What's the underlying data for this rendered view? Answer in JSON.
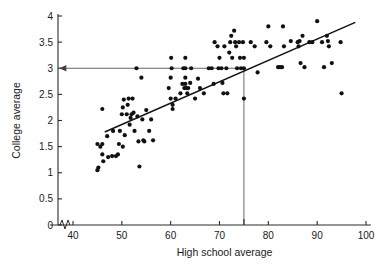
{
  "chart_data": {
    "type": "scatter",
    "title": "",
    "xlabel": "High school average",
    "ylabel": "College average",
    "xlim": [
      36,
      101
    ],
    "ylim": [
      0,
      4
    ],
    "xticks": [
      40,
      50,
      60,
      70,
      80,
      90,
      100
    ],
    "xtick_labels": [
      "40",
      "50",
      "60",
      "70",
      "80",
      "90",
      "100"
    ],
    "yticks": [
      0,
      0.5,
      1,
      1.5,
      2,
      2.5,
      3,
      3.5,
      4
    ],
    "ytick_labels": [
      "0",
      "0.5",
      "1",
      "1.5",
      "2",
      "2.5",
      "3",
      "3.5",
      "4"
    ],
    "grid": false,
    "legend": "none",
    "axis_break": {
      "axis": "x",
      "at": 37.5,
      "label": "zigzag-break"
    },
    "regression_line": {
      "x_start": 46.5,
      "y_start": 1.78,
      "x_end": 97.8,
      "y_end": 3.88,
      "slope": 0.0409,
      "intercept": -0.125
    },
    "reference_lines": [
      {
        "name": "horizontal-at-college-3",
        "orientation": "horizontal",
        "y": 3,
        "x_from": 37.2,
        "x_to": 75,
        "arrow": "left"
      },
      {
        "name": "vertical-at-highschool-75",
        "orientation": "vertical",
        "x": 75,
        "y_from": 0,
        "y_to": 3,
        "arrow": "none"
      }
    ],
    "points": [
      [
        45.0,
        1.55
      ],
      [
        45.0,
        1.05
      ],
      [
        45.2,
        1.1
      ],
      [
        45.6,
        1.5
      ],
      [
        46.0,
        1.55
      ],
      [
        46.0,
        2.22
      ],
      [
        46.2,
        1.22
      ],
      [
        46.0,
        1.35
      ],
      [
        47.0,
        1.7
      ],
      [
        47.2,
        1.3
      ],
      [
        48.0,
        1.32
      ],
      [
        48.2,
        1.8
      ],
      [
        48.8,
        1.32
      ],
      [
        49.2,
        1.35
      ],
      [
        49.4,
        1.55
      ],
      [
        49.6,
        1.8
      ],
      [
        50.0,
        2.12
      ],
      [
        50.2,
        2.25
      ],
      [
        50.2,
        1.5
      ],
      [
        50.4,
        2.4
      ],
      [
        50.6,
        1.72
      ],
      [
        51.0,
        2.12
      ],
      [
        51.2,
        2.3
      ],
      [
        51.4,
        2.42
      ],
      [
        51.6,
        1.92
      ],
      [
        51.8,
        2.05
      ],
      [
        52.0,
        2.12
      ],
      [
        52.2,
        2.42
      ],
      [
        52.4,
        2.15
      ],
      [
        52.6,
        1.8
      ],
      [
        53.0,
        3.0
      ],
      [
        53.2,
        2.08
      ],
      [
        53.4,
        1.6
      ],
      [
        53.6,
        1.12
      ],
      [
        54.0,
        2.82
      ],
      [
        54.2,
        2.02
      ],
      [
        54.4,
        1.62
      ],
      [
        54.6,
        1.6
      ],
      [
        55.0,
        2.2
      ],
      [
        55.6,
        1.8
      ],
      [
        56.0,
        2.02
      ],
      [
        56.4,
        1.62
      ],
      [
        59.6,
        2.62
      ],
      [
        60.0,
        2.42
      ],
      [
        60.0,
        2.82
      ],
      [
        60.1,
        3.2
      ],
      [
        60.2,
        3.0
      ],
      [
        60.4,
        2.3
      ],
      [
        60.4,
        2.22
      ],
      [
        61.0,
        2.42
      ],
      [
        62.0,
        2.52
      ],
      [
        62.4,
        2.7
      ],
      [
        62.6,
        3.0
      ],
      [
        62.8,
        2.62
      ],
      [
        63.0,
        3.2
      ],
      [
        63.0,
        3.0
      ],
      [
        63.0,
        2.82
      ],
      [
        63.0,
        2.7
      ],
      [
        63.2,
        2.62
      ],
      [
        63.4,
        2.52
      ],
      [
        63.6,
        2.62
      ],
      [
        64.0,
        2.72
      ],
      [
        64.2,
        3.0
      ],
      [
        65.0,
        2.42
      ],
      [
        65.6,
        2.8
      ],
      [
        66.0,
        2.62
      ],
      [
        66.8,
        2.52
      ],
      [
        67.8,
        3.0
      ],
      [
        68.4,
        3.0
      ],
      [
        68.8,
        2.7
      ],
      [
        69.0,
        3.5
      ],
      [
        69.6,
        3.42
      ],
      [
        69.8,
        3.0
      ],
      [
        70.0,
        3.2
      ],
      [
        70.4,
        3.0
      ],
      [
        70.6,
        2.72
      ],
      [
        70.8,
        2.52
      ],
      [
        71.0,
        3.42
      ],
      [
        71.4,
        3.0
      ],
      [
        71.6,
        2.52
      ],
      [
        72.0,
        3.3
      ],
      [
        72.2,
        3.5
      ],
      [
        72.4,
        3.62
      ],
      [
        72.6,
        3.2
      ],
      [
        73.0,
        3.72
      ],
      [
        73.2,
        3.5
      ],
      [
        73.4,
        3.42
      ],
      [
        73.6,
        3.0
      ],
      [
        74.0,
        3.5
      ],
      [
        74.2,
        3.2
      ],
      [
        74.4,
        3.0
      ],
      [
        74.8,
        3.5
      ],
      [
        75.0,
        3.2
      ],
      [
        75.0,
        3.0
      ],
      [
        75.0,
        2.42
      ],
      [
        76.4,
        3.5
      ],
      [
        77.2,
        3.42
      ],
      [
        77.8,
        2.92
      ],
      [
        79.6,
        3.5
      ],
      [
        80.0,
        3.8
      ],
      [
        80.4,
        3.42
      ],
      [
        82.0,
        3.02
      ],
      [
        82.4,
        3.02
      ],
      [
        82.8,
        3.02
      ],
      [
        83.0,
        3.8
      ],
      [
        83.2,
        3.42
      ],
      [
        84.6,
        3.52
      ],
      [
        86.0,
        3.5
      ],
      [
        86.2,
        3.42
      ],
      [
        86.4,
        3.52
      ],
      [
        86.6,
        3.1
      ],
      [
        87.0,
        3.62
      ],
      [
        87.4,
        3.02
      ],
      [
        88.4,
        3.5
      ],
      [
        89.0,
        3.5
      ],
      [
        90.0,
        3.9
      ],
      [
        91.0,
        3.5
      ],
      [
        91.4,
        3.02
      ],
      [
        92.0,
        3.62
      ],
      [
        92.2,
        3.52
      ],
      [
        92.4,
        3.42
      ],
      [
        93.0,
        3.1
      ],
      [
        94.8,
        3.5
      ],
      [
        95.0,
        2.52
      ]
    ]
  },
  "colors": {
    "point": "#111111",
    "fit_line": "#111111",
    "reference_line": "#555555",
    "axis": "#2b2b2b",
    "background": "#ffffff"
  }
}
